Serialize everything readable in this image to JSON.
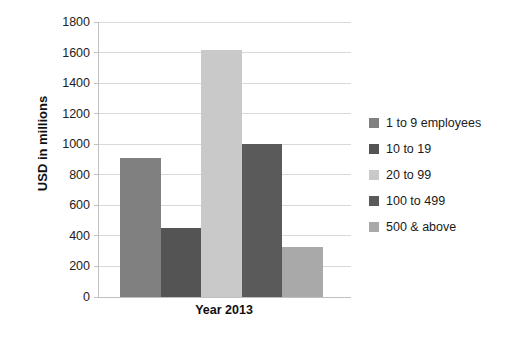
{
  "chart_data": {
    "type": "bar",
    "title": "",
    "subtitle": "",
    "xlabel": "Year 2013",
    "ylabel": "USD in millions",
    "categories": [
      "Year 2013"
    ],
    "legend_position": "right",
    "grid": true,
    "ylim": [
      0,
      1800
    ],
    "ytick_step": 200,
    "ytick_labels": [
      "1800",
      "1600",
      "1400",
      "1200",
      "1000",
      "800",
      "600",
      "400",
      "200",
      "0"
    ],
    "ytick_values": [
      1800,
      1600,
      1400,
      1200,
      1000,
      800,
      600,
      400,
      200,
      0
    ],
    "series": [
      {
        "name": "1 to 9 employees",
        "values": [
          910
        ],
        "color": "#808080"
      },
      {
        "name": "10 to 19",
        "values": [
          455
        ],
        "color": "#545454"
      },
      {
        "name": "20 to 99",
        "values": [
          1620
        ],
        "color": "#c9c9c9"
      },
      {
        "name": "100 to 499",
        "values": [
          1000
        ],
        "color": "#5a5a5a"
      },
      {
        "name": "500 & above",
        "values": [
          325
        ],
        "color": "#a9a9a9"
      }
    ]
  },
  "legend": {
    "items": [
      {
        "label": "1 to 9 employees",
        "color": "#808080"
      },
      {
        "label": "10 to 19",
        "color": "#545454"
      },
      {
        "label": "20 to 99",
        "color": "#c9c9c9"
      },
      {
        "label": "100 to 499",
        "color": "#5a5a5a"
      },
      {
        "label": "500 & above",
        "color": "#a9a9a9"
      }
    ]
  },
  "axes": {
    "y_title": "USD in millions",
    "x_title": "Year 2013"
  }
}
